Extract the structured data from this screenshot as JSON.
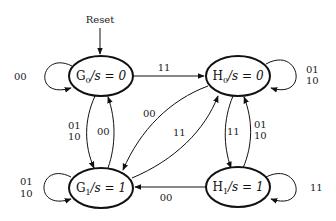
{
  "diagram": {
    "type": "state-machine",
    "reset_label": "Reset",
    "states": [
      {
        "id": "G0",
        "name": "G",
        "sub": "0",
        "output": "/s = 0"
      },
      {
        "id": "H0",
        "name": "H",
        "sub": "0",
        "output": "/s = 0"
      },
      {
        "id": "G1",
        "name": "G",
        "sub": "1",
        "output": "/s = 1"
      },
      {
        "id": "H1",
        "name": "H",
        "sub": "1",
        "output": "/s = 1"
      }
    ],
    "transitions": [
      {
        "from": "G0",
        "to": "G0",
        "label": "00"
      },
      {
        "from": "G0",
        "to": "H0",
        "label": "11"
      },
      {
        "from": "G0",
        "to": "G1",
        "label_line1": "01",
        "label_line2": "10"
      },
      {
        "from": "G1",
        "to": "G0",
        "label": "00"
      },
      {
        "from": "H0",
        "to": "H0",
        "label_line1": "01",
        "label_line2": "10"
      },
      {
        "from": "H0",
        "to": "G1",
        "label": "00"
      },
      {
        "from": "G1",
        "to": "H0",
        "label": "11"
      },
      {
        "from": "H0",
        "to": "H1",
        "label": "11"
      },
      {
        "from": "H1",
        "to": "H0",
        "label_line1": "01",
        "label_line2": "10"
      },
      {
        "from": "G1",
        "to": "G1",
        "label_line1": "01",
        "label_line2": "10"
      },
      {
        "from": "H1",
        "to": "G1",
        "label": "00"
      },
      {
        "from": "H1",
        "to": "H1",
        "label": "11"
      }
    ]
  }
}
